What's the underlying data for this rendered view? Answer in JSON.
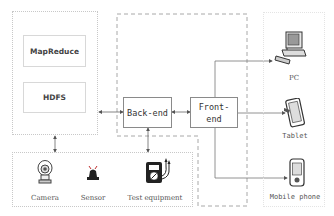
{
  "diagram": {
    "cluster": {
      "modules": [
        {
          "label": "MapReduce"
        },
        {
          "label": "HDFS"
        }
      ]
    },
    "server": {
      "backend": {
        "label": "Back-end"
      },
      "frontend": {
        "label": "Front-end",
        "line1": "Front-",
        "line2": "end"
      }
    },
    "data_sources": {
      "devices": [
        {
          "label": "Camera",
          "icon": "camera-icon"
        },
        {
          "label": "Sensor",
          "icon": "sensor-alarm-icon"
        },
        {
          "label": "Test equipment",
          "icon": "multimeter-icon"
        }
      ]
    },
    "clients": {
      "devices": [
        {
          "label": "PC",
          "icon": "desktop-computer-icon"
        },
        {
          "label": "Tablet",
          "icon": "tablet-icon"
        },
        {
          "label": "Mobile phone",
          "icon": "mobile-phone-icon"
        }
      ]
    },
    "colors": {
      "line": "#777777",
      "dashed_border": "#a8a8a8",
      "dotted_border": "#c8c8c8",
      "box_border": "#8a8a8a"
    }
  }
}
